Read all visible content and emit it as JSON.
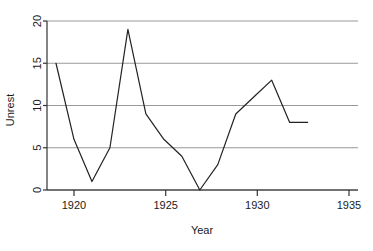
{
  "chart_data": {
    "type": "line",
    "title": "",
    "subtitle": "",
    "xlabel": "Year",
    "ylabel": "Unrest",
    "x": [
      1919,
      1920,
      1921,
      1922,
      1923,
      1924,
      1925,
      1926,
      1927,
      1928,
      1929,
      1930,
      1931,
      1932,
      1933
    ],
    "values": [
      15,
      6,
      1,
      5,
      19,
      9,
      6,
      4,
      0,
      3,
      9,
      11,
      13,
      8,
      8
    ],
    "series": [
      {
        "name": "Unrest",
        "values": [
          15,
          6,
          1,
          5,
          19,
          9,
          6,
          4,
          0,
          3,
          9,
          11,
          13,
          8,
          8
        ],
        "color": "#222222"
      }
    ],
    "xlim": [
      1918.5,
      1935.8
    ],
    "ylim": [
      0,
      20
    ],
    "xticks": [
      1920,
      1925,
      1930,
      1935
    ],
    "xticklabels": [
      "1920",
      "1925",
      "1930",
      "1935"
    ],
    "yticks": [
      0,
      5,
      10,
      15,
      20
    ],
    "yticklabels": [
      "0",
      "5",
      "10",
      "15",
      "20"
    ],
    "grid": "horizontal",
    "gridcolor": "#999999",
    "legend": "none",
    "annotations": []
  },
  "axes": {
    "x_title": "Year",
    "y_title": "Unrest",
    "x_tick_0": "1920",
    "x_tick_1": "1925",
    "x_tick_2": "1930",
    "x_tick_3": "1935",
    "y_tick_0": "0",
    "y_tick_1": "5",
    "y_tick_2": "10",
    "y_tick_3": "15",
    "y_tick_4": "20"
  }
}
